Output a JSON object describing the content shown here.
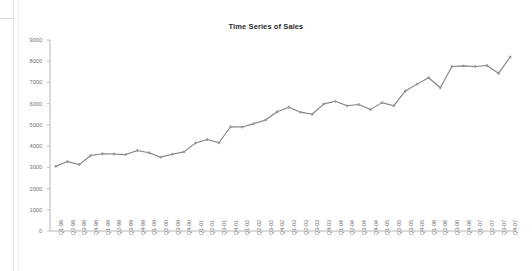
{
  "chart_data": {
    "type": "line",
    "title": "Time Series of Sales",
    "xlabel": "",
    "ylabel": "",
    "ylim": [
      0,
      9000
    ],
    "ytick_step": 1000,
    "yticks": [
      "9000",
      "8000",
      "7000",
      "6000",
      "5000",
      "4000",
      "3000",
      "2000",
      "1000",
      "0"
    ],
    "grid": false,
    "legend": "none",
    "marker": "diamond",
    "line_color": "#808080",
    "marker_color": "#9a9a9a",
    "axis_color": "#b0b0b0",
    "categories": [
      "Q1-98",
      "Q2-98",
      "Q3-98",
      "Q4-98",
      "Q1-99",
      "Q2-99",
      "Q3-99",
      "Q4-99",
      "Q1-00",
      "Q2-00",
      "Q3-00",
      "Q4-00",
      "Q1-01",
      "Q2-01",
      "Q3-01",
      "Q4-01",
      "Q1-02",
      "Q2-02",
      "Q3-02",
      "Q4-02",
      "Q1-03",
      "Q2-03",
      "Q3-03",
      "Q4-03",
      "Q1-04",
      "Q2-04",
      "Q3-04",
      "Q4-04",
      "Q1-05",
      "Q2-05",
      "Q3-05",
      "Q4-05",
      "Q1-06",
      "Q2-06",
      "Q3-06",
      "Q4-06",
      "Q1-07",
      "Q2-07",
      "Q3-07",
      "Q4-07"
    ],
    "values": [
      3050,
      3270,
      3130,
      3560,
      3640,
      3630,
      3600,
      3790,
      3690,
      3480,
      3620,
      3730,
      4150,
      4310,
      4160,
      4910,
      4900,
      5060,
      5230,
      5620,
      5830,
      5600,
      5500,
      5990,
      6110,
      5900,
      5960,
      5720,
      6050,
      5900,
      6600,
      6920,
      7220,
      6750,
      7750,
      7780,
      7750,
      7800,
      7430,
      8200
    ],
    "series_name": "Sales"
  }
}
